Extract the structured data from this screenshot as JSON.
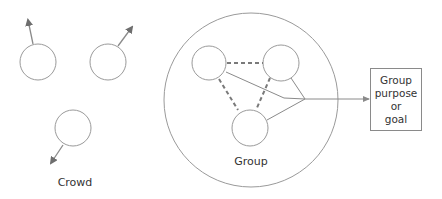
{
  "diagram": {
    "crowd": {
      "label": "Crowd",
      "members": [
        {
          "cx": 38,
          "cy": 62,
          "r": 18,
          "arrow": {
            "x1": 33,
            "y1": 44,
            "x2": 27,
            "y2": 17
          }
        },
        {
          "cx": 108,
          "cy": 62,
          "r": 18,
          "arrow": {
            "x1": 118,
            "y1": 46,
            "x2": 134,
            "y2": 25
          }
        },
        {
          "cx": 73,
          "cy": 128,
          "r": 18,
          "arrow": {
            "x1": 62,
            "y1": 144,
            "x2": 49,
            "y2": 165
          }
        }
      ]
    },
    "group": {
      "label": "Group",
      "boundary": {
        "cx": 251,
        "cy": 100,
        "r": 87
      },
      "members": [
        {
          "cx": 209,
          "cy": 63,
          "r": 17
        },
        {
          "cx": 281,
          "cy": 63,
          "r": 18
        },
        {
          "cx": 250,
          "cy": 128,
          "r": 18
        }
      ],
      "dashed_links": "member relationships",
      "junction": {
        "x": 305,
        "y": 99
      }
    },
    "goal": {
      "lines": [
        "Group",
        "purpose",
        "or",
        "goal"
      ]
    },
    "colors": {
      "stroke": "#9a9a9a",
      "dashed": "#7a7a7a",
      "arrow": "#6e6e6e",
      "text": "#333333"
    }
  }
}
